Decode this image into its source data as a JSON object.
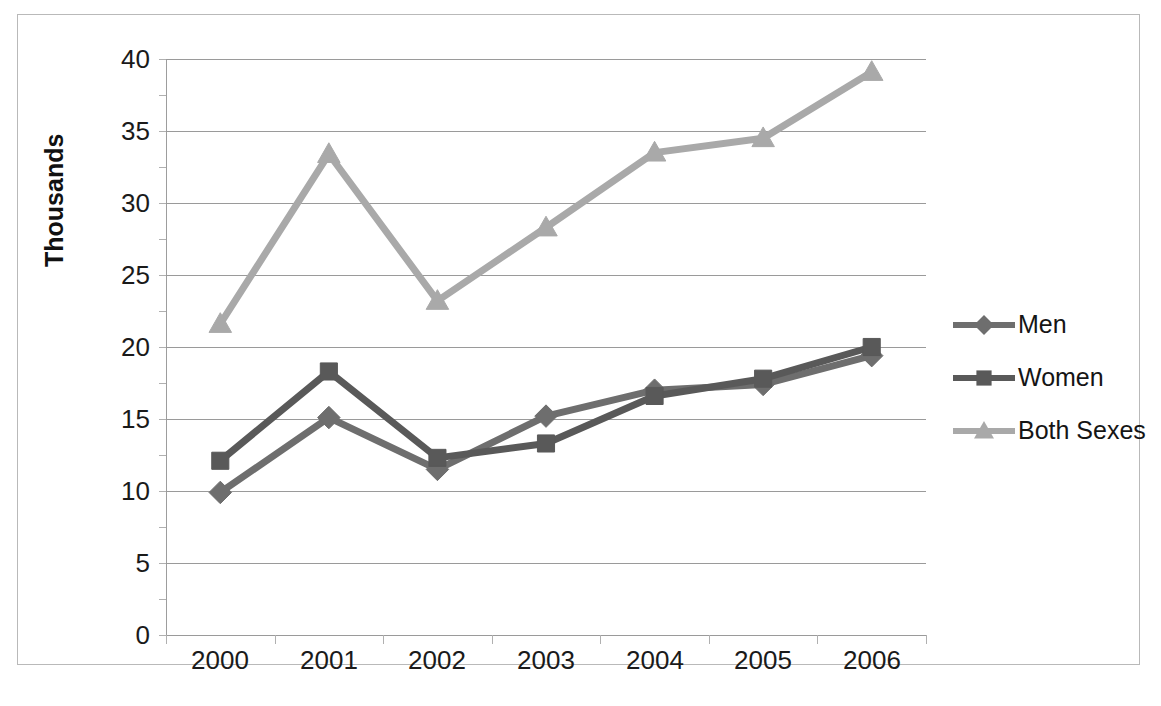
{
  "chart_data": {
    "type": "line",
    "title": "",
    "subtitle": "",
    "xlabel": "",
    "ylabel": "Thousands",
    "categories": [
      "2000",
      "2001",
      "2002",
      "2003",
      "2004",
      "2005",
      "2006"
    ],
    "x": [
      2000,
      2001,
      2002,
      2003,
      2004,
      2005,
      2006
    ],
    "ylim": [
      0,
      40
    ],
    "yticks": [
      0,
      5,
      10,
      15,
      20,
      25,
      30,
      35,
      40
    ],
    "ytick_labels": [
      "0",
      "5",
      "10",
      "15",
      "20",
      "25",
      "30",
      "35",
      "40"
    ],
    "grid": true,
    "grid_axis": "y",
    "legend_position": "right",
    "series": [
      {
        "name": "Men",
        "marker": "diamond",
        "color": "#6e6e6e",
        "values": [
          9.9,
          15.1,
          11.5,
          15.2,
          17.0,
          17.4,
          19.4
        ]
      },
      {
        "name": "Women",
        "marker": "square",
        "color": "#595959",
        "values": [
          12.1,
          18.3,
          12.3,
          13.3,
          16.6,
          17.8,
          20.0
        ]
      },
      {
        "name": "Both Sexes",
        "marker": "triangle",
        "color": "#a9a9a9",
        "values": [
          21.6,
          33.4,
          23.2,
          28.3,
          33.5,
          34.5,
          39.1
        ]
      }
    ]
  },
  "axes": {
    "y_title": "Thousands",
    "y_tick_labels": [
      "40",
      "35",
      "30",
      "25",
      "20",
      "15",
      "10",
      "5",
      "0"
    ],
    "x_tick_labels": [
      "2000",
      "2001",
      "2002",
      "2003",
      "2004",
      "2005",
      "2006"
    ]
  },
  "legend": {
    "entries": [
      {
        "label": "Men",
        "color": "#6e6e6e",
        "marker": "diamond"
      },
      {
        "label": "Women",
        "color": "#595959",
        "marker": "square"
      },
      {
        "label": "Both Sexes",
        "color": "#a9a9a9",
        "marker": "triangle"
      }
    ]
  },
  "colors": {
    "men": "#6e6e6e",
    "women": "#595959",
    "both_sexes": "#a9a9a9",
    "gridline": "#9a9a9a",
    "axis": "#9d9d9d",
    "frame": "#b9b9b9",
    "text": "#1a1a1a",
    "background": "#ffffff"
  }
}
